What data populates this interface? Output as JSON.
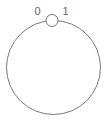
{
  "diagram": {
    "type": "ring",
    "ring": {
      "cx": 53.5,
      "cy": 67.5,
      "r": 47,
      "stroke": "#777777",
      "stroke_width": 1,
      "fill": "#ffffff"
    },
    "node": {
      "cx": 52,
      "cy": 20.5,
      "r": 6,
      "stroke": "#777777",
      "fill": "#ffffff"
    },
    "labels": [
      {
        "text": "0",
        "x": 37.5,
        "y": 15
      },
      {
        "text": "1",
        "x": 65.5,
        "y": 15
      }
    ]
  }
}
